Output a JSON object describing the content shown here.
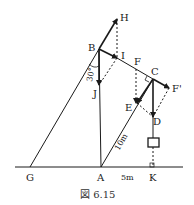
{
  "figure": {
    "caption": "図 6.15",
    "points": {
      "H": "H",
      "B": "B",
      "I": "I",
      "F": "F",
      "C": "C",
      "F_prime": "F'",
      "J": "J",
      "E": "E",
      "D": "D",
      "G": "G",
      "A": "A",
      "K": "K"
    },
    "measurements": {
      "angle": "30°",
      "length_AC": "10m",
      "distance_AK": "5m"
    },
    "colors": {
      "line": "#1a1a1a",
      "background": "#ffffff"
    }
  }
}
